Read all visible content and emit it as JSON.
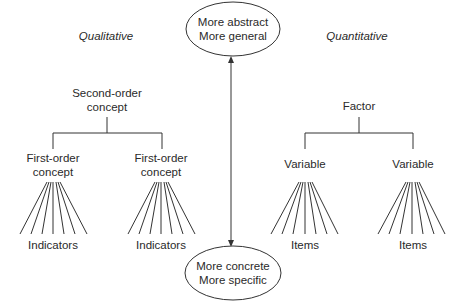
{
  "diagram": {
    "colors": {
      "stroke": "#333333",
      "text": "#2a2a2a",
      "background": "#ffffff"
    },
    "top_ellipse": {
      "line1": "More abstract",
      "line2": "More general"
    },
    "bottom_ellipse": {
      "line1": "More concrete",
      "line2": "More specific"
    },
    "qualitative": {
      "heading": "Qualitative",
      "root": {
        "line1": "Second-order",
        "line2": "concept"
      },
      "children": [
        {
          "line1": "First-order",
          "line2": "concept",
          "leaf_label": "Indicators",
          "fan_lines": 7
        },
        {
          "line1": "First-order",
          "line2": "concept",
          "leaf_label": "Indicators",
          "fan_lines": 7
        }
      ]
    },
    "quantitative": {
      "heading": "Quantitative",
      "root": {
        "line1": "Factor"
      },
      "children": [
        {
          "line1": "Variable",
          "leaf_label": "Items",
          "fan_lines": 7
        },
        {
          "line1": "Variable",
          "leaf_label": "Items",
          "fan_lines": 7
        }
      ]
    },
    "axis_arrow": {
      "direction": "bidirectional-vertical"
    }
  }
}
